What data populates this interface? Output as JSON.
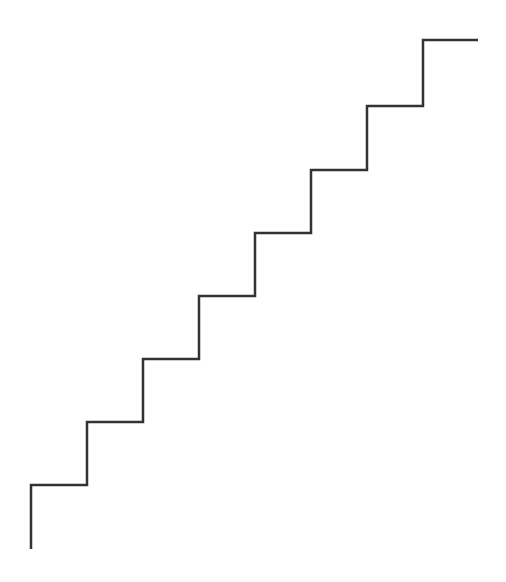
{
  "diagram": {
    "type": "staircase-line",
    "stroke_color": "#333333",
    "stroke_width": 2.5,
    "background": "#ffffff",
    "steps": 8,
    "points": [
      [
        31,
        549
      ],
      [
        31,
        485
      ],
      [
        87,
        485
      ],
      [
        87,
        422
      ],
      [
        143,
        422
      ],
      [
        143,
        359
      ],
      [
        199,
        359
      ],
      [
        199,
        296
      ],
      [
        255,
        296
      ],
      [
        255,
        233
      ],
      [
        311,
        233
      ],
      [
        311,
        170
      ],
      [
        367,
        170
      ],
      [
        367,
        106
      ],
      [
        423,
        106
      ],
      [
        423,
        40
      ],
      [
        478,
        40
      ]
    ]
  }
}
